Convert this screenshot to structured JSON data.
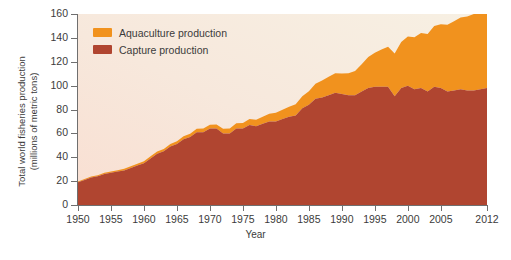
{
  "chart_data": {
    "type": "area",
    "stacked": true,
    "title": "",
    "xlabel": "Year",
    "ylabel": "Total world fisheries production\n(millions of metric tons)",
    "xlim": [
      1950,
      2012
    ],
    "ylim": [
      0,
      160
    ],
    "ytick_step": 20,
    "grid": false,
    "legend_position": "top-left",
    "xticks": [
      "1950",
      "1955",
      "1960",
      "1965",
      "1970",
      "1975",
      "1980",
      "1985",
      "1990",
      "1995",
      "2000",
      "2005",
      "2012"
    ],
    "xtick_values": [
      1950,
      1955,
      1960,
      1965,
      1970,
      1975,
      1980,
      1985,
      1990,
      1995,
      2000,
      2005,
      2012
    ],
    "yticks": [
      "0",
      "20",
      "40",
      "60",
      "80",
      "100",
      "120",
      "140",
      "160"
    ],
    "ytick_values": [
      0,
      20,
      40,
      60,
      80,
      100,
      120,
      140,
      160
    ],
    "x": [
      1950,
      1951,
      1952,
      1953,
      1954,
      1955,
      1956,
      1957,
      1958,
      1959,
      1960,
      1961,
      1962,
      1963,
      1964,
      1965,
      1966,
      1967,
      1968,
      1969,
      1970,
      1971,
      1972,
      1973,
      1974,
      1975,
      1976,
      1977,
      1978,
      1979,
      1980,
      1981,
      1982,
      1983,
      1984,
      1985,
      1986,
      1987,
      1988,
      1989,
      1990,
      1991,
      1992,
      1993,
      1994,
      1995,
      1996,
      1997,
      1998,
      1999,
      2000,
      2001,
      2002,
      2003,
      2004,
      2005,
      2006,
      2007,
      2008,
      2009,
      2010,
      2011,
      2012
    ],
    "series": [
      {
        "name": "Capture production",
        "color": "#b04530",
        "values": [
          19,
          21,
          23,
          24,
          26,
          27,
          28,
          29,
          31,
          33,
          35,
          39,
          43,
          45,
          49,
          51,
          55,
          57,
          61,
          61,
          64,
          64,
          60,
          60,
          64,
          64,
          67,
          66,
          68,
          70,
          70,
          72,
          74,
          75,
          81,
          84,
          89,
          90,
          92,
          94,
          93,
          92,
          92,
          95,
          98,
          99,
          99,
          99,
          91,
          98,
          100,
          97,
          98,
          95,
          99,
          98,
          95,
          96,
          97,
          96,
          96,
          97,
          98
        ],
        "end_value": 98
      },
      {
        "name": "Aquaculture production",
        "color": "#f1921e",
        "values": [
          0.6,
          0.7,
          0.8,
          0.9,
          1.0,
          1.1,
          1.2,
          1.3,
          1.4,
          1.5,
          1.7,
          1.8,
          1.9,
          2.0,
          2.2,
          2.3,
          2.5,
          2.7,
          2.9,
          3.0,
          3.3,
          3.5,
          3.8,
          4.1,
          4.4,
          4.7,
          5.1,
          5.5,
          6.0,
          6.5,
          7.2,
          7.8,
          8.4,
          9.3,
          10.2,
          11.3,
          12.6,
          14.2,
          15.5,
          16.4,
          17.2,
          18.4,
          20.3,
          23.0,
          25.9,
          28.5,
          31.2,
          33.6,
          36.0,
          38.6,
          41.2,
          43.6,
          46.0,
          48.2,
          51.0,
          53.5,
          56.0,
          58.0,
          60.0,
          62.0,
          64.0,
          66.0,
          67.0
        ],
        "end_value": 67
      }
    ],
    "total_2012": 158,
    "total_1950": 20,
    "plot_background_gradient": {
      "top_right": "#f7f0e3",
      "bottom_left": "#f9dfd2"
    }
  },
  "legend": {
    "items": [
      {
        "label": "Aquaculture production",
        "color": "#f1921e"
      },
      {
        "label": "Capture production",
        "color": "#b04530"
      }
    ]
  }
}
